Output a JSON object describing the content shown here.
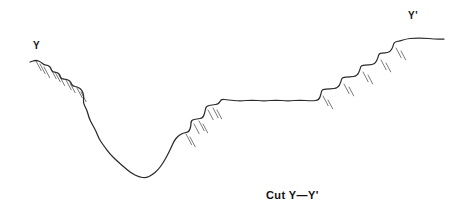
{
  "figure": {
    "kind": "geologic-cross-section",
    "caption": "Cut Y—Y'",
    "background_color": "#ffffff",
    "line_color": "#2b2b2b",
    "hachure_color": "#6b6b6b",
    "text_color": "#141414",
    "width": 452,
    "height": 221
  },
  "labels": {
    "left_endpoint": "Y",
    "right_endpoint": "Y'"
  },
  "chart_data": {
    "type": "line",
    "title": "Cut Y—Y'",
    "subtitle": "",
    "xlabel": "",
    "ylabel": "",
    "grid": false,
    "legend": "none",
    "axis_visible": false,
    "xlim": [
      0,
      452
    ],
    "ylim": [
      221,
      0
    ],
    "series": [
      {
        "name": "topographic-profile",
        "description": "Hand-drawn terrain surface: stepped fault scarps descending from left rim, a deep V-shaped valley floor, a stepped rise to a broad central plateau, then a staircase of terraces climbing to the high right-hand bench.",
        "points": [
          [
            30,
            62
          ],
          [
            36,
            60
          ],
          [
            41,
            62
          ],
          [
            44,
            65
          ],
          [
            48,
            65
          ],
          [
            51,
            68
          ],
          [
            52,
            72
          ],
          [
            57,
            72
          ],
          [
            60,
            75
          ],
          [
            61,
            79
          ],
          [
            67,
            79
          ],
          [
            71,
            82
          ],
          [
            72,
            86
          ],
          [
            78,
            87
          ],
          [
            82,
            90
          ],
          [
            84,
            96
          ],
          [
            83,
            103
          ],
          [
            87,
            110
          ],
          [
            89,
            118
          ],
          [
            92,
            124
          ],
          [
            96,
            131
          ],
          [
            99,
            139
          ],
          [
            104,
            146
          ],
          [
            110,
            154
          ],
          [
            117,
            161
          ],
          [
            124,
            167
          ],
          [
            131,
            173
          ],
          [
            139,
            177
          ],
          [
            146,
            178
          ],
          [
            152,
            175
          ],
          [
            158,
            170
          ],
          [
            163,
            163
          ],
          [
            167,
            156
          ],
          [
            171,
            148
          ],
          [
            174,
            141
          ],
          [
            178,
            136
          ],
          [
            183,
            133
          ],
          [
            189,
            132
          ],
          [
            191,
            126
          ],
          [
            191,
            120
          ],
          [
            197,
            119
          ],
          [
            203,
            118
          ],
          [
            205,
            112
          ],
          [
            206,
            106
          ],
          [
            212,
            105
          ],
          [
            219,
            104
          ],
          [
            221,
            99
          ],
          [
            228,
            100
          ],
          [
            240,
            101
          ],
          [
            252,
            100
          ],
          [
            264,
            101
          ],
          [
            276,
            100
          ],
          [
            288,
            101
          ],
          [
            300,
            100
          ],
          [
            312,
            101
          ],
          [
            319,
            100
          ],
          [
            321,
            94
          ],
          [
            322,
            89
          ],
          [
            330,
            89
          ],
          [
            338,
            88
          ],
          [
            341,
            82
          ],
          [
            342,
            77
          ],
          [
            350,
            77
          ],
          [
            357,
            76
          ],
          [
            360,
            70
          ],
          [
            361,
            65
          ],
          [
            369,
            65
          ],
          [
            375,
            64
          ],
          [
            378,
            58
          ],
          [
            379,
            53
          ],
          [
            385,
            53
          ],
          [
            390,
            52
          ],
          [
            393,
            47
          ],
          [
            394,
            42
          ],
          [
            400,
            41
          ],
          [
            406,
            39
          ],
          [
            414,
            38
          ],
          [
            424,
            38
          ],
          [
            434,
            39
          ],
          [
            444,
            39
          ]
        ]
      }
    ],
    "hachures": [
      {
        "x": 36,
        "y": 61,
        "angle": 62,
        "length": 11
      },
      {
        "x": 40,
        "y": 64,
        "angle": 62,
        "length": 11
      },
      {
        "x": 44,
        "y": 67,
        "angle": 62,
        "length": 12
      },
      {
        "x": 51,
        "y": 69,
        "angle": 62,
        "length": 11
      },
      {
        "x": 55,
        "y": 72,
        "angle": 62,
        "length": 11
      },
      {
        "x": 59,
        "y": 75,
        "angle": 62,
        "length": 12
      },
      {
        "x": 66,
        "y": 80,
        "angle": 62,
        "length": 11
      },
      {
        "x": 70,
        "y": 83,
        "angle": 62,
        "length": 11
      },
      {
        "x": 77,
        "y": 88,
        "angle": 62,
        "length": 11
      },
      {
        "x": 81,
        "y": 92,
        "angle": 62,
        "length": 11
      },
      {
        "x": 186,
        "y": 134,
        "angle": 62,
        "length": 12
      },
      {
        "x": 190,
        "y": 137,
        "angle": 62,
        "length": 11
      },
      {
        "x": 194,
        "y": 124,
        "angle": 62,
        "length": 11
      },
      {
        "x": 199,
        "y": 121,
        "angle": 62,
        "length": 11
      },
      {
        "x": 203,
        "y": 124,
        "angle": 62,
        "length": 10
      },
      {
        "x": 208,
        "y": 110,
        "angle": 62,
        "length": 11
      },
      {
        "x": 213,
        "y": 108,
        "angle": 62,
        "length": 11
      },
      {
        "x": 217,
        "y": 110,
        "angle": 62,
        "length": 10
      },
      {
        "x": 323,
        "y": 96,
        "angle": 62,
        "length": 11
      },
      {
        "x": 328,
        "y": 100,
        "angle": 62,
        "length": 10
      },
      {
        "x": 344,
        "y": 84,
        "angle": 62,
        "length": 11
      },
      {
        "x": 349,
        "y": 87,
        "angle": 62,
        "length": 10
      },
      {
        "x": 363,
        "y": 72,
        "angle": 62,
        "length": 11
      },
      {
        "x": 368,
        "y": 75,
        "angle": 62,
        "length": 10
      },
      {
        "x": 381,
        "y": 60,
        "angle": 62,
        "length": 11
      },
      {
        "x": 386,
        "y": 63,
        "angle": 62,
        "length": 10
      },
      {
        "x": 396,
        "y": 48,
        "angle": 62,
        "length": 11
      },
      {
        "x": 401,
        "y": 51,
        "angle": 62,
        "length": 10
      }
    ],
    "annotations": [
      {
        "text": "Y",
        "x": 33,
        "y": 41,
        "role": "left-endpoint-label"
      },
      {
        "text": "Y'",
        "x": 408,
        "y": 11,
        "role": "right-endpoint-label"
      },
      {
        "text": "Cut Y—Y'",
        "x": 266,
        "y": 190,
        "role": "caption"
      }
    ]
  }
}
